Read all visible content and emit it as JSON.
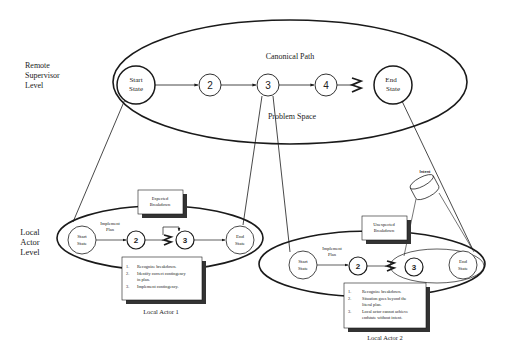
{
  "levels": {
    "remote": [
      "Remote",
      "Supervisor",
      "Level"
    ],
    "local": [
      "Local",
      "Actor",
      "Level"
    ]
  },
  "supervisor": {
    "canonical_path_label": "Canonical Path",
    "problem_space_label": "Problem Space",
    "start_state": [
      "Start",
      "State"
    ],
    "nodes": [
      "2",
      "3",
      "4"
    ],
    "end_state": [
      "End",
      "State"
    ]
  },
  "actor1": {
    "title": "Local Actor 1",
    "plan_label": [
      "Implement",
      "Plan"
    ],
    "start_state": [
      "Start",
      "State"
    ],
    "nodes": [
      "2",
      "3"
    ],
    "end_state": [
      "End",
      "State"
    ],
    "breakdown_box": [
      "Expected",
      "Breakdown"
    ],
    "steps": [
      {
        "num": "1.",
        "lines": [
          "Recognize breakdown."
        ]
      },
      {
        "num": "2.",
        "lines": [
          "Identify correct contingency",
          "in plan."
        ]
      },
      {
        "num": "3.",
        "lines": [
          "Implement contingency."
        ]
      }
    ]
  },
  "actor2": {
    "title": "Local Actor 2",
    "plan_label": [
      "Implement",
      "Plan"
    ],
    "start_state": [
      "Start",
      "State"
    ],
    "nodes": [
      "2",
      "3"
    ],
    "end_state": [
      "End",
      "State"
    ],
    "breakdown_box": [
      "Unexpected",
      "Breakdown"
    ],
    "intent_label": "Intent",
    "steps": [
      {
        "num": "1.",
        "lines": [
          "Recognize breakdown."
        ]
      },
      {
        "num": "2.",
        "lines": [
          "Situation goes beyond the",
          "literal plan."
        ]
      },
      {
        "num": "3.",
        "lines": [
          "Local actor cannot achieve",
          "endstate without intent."
        ]
      }
    ]
  },
  "colors": {
    "stroke": "#1a1a1a",
    "shadow": "#333333",
    "background": "#ffffff"
  }
}
